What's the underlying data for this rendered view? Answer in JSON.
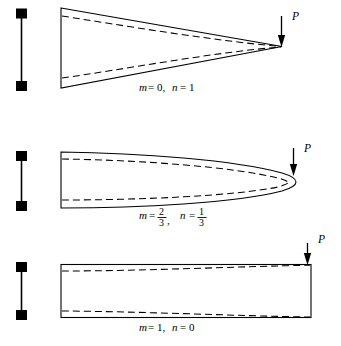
{
  "figure": {
    "name": "column-buckling-modes-figure",
    "background_color": "#ffffff",
    "line_color": "#000000",
    "width": 341,
    "height": 346
  },
  "panels": [
    {
      "id": "panel-1",
      "shape": "triangle",
      "caption": {
        "full": "m = 0, n = 1",
        "m_var": "m",
        "m_eq": "= 0,",
        "n_var": "n",
        "n_eq": "= 1",
        "m_value": "0",
        "n_value": "1"
      },
      "load_label": "P",
      "support_label": "pinned-pinned-support"
    },
    {
      "id": "panel-2",
      "shape": "parabolic-nose",
      "caption": {
        "full": "m = 2/3, n = 1/3",
        "m_var": "m",
        "m_eq": "=",
        "m_num": "2",
        "m_den": "3",
        "m_trail": ",",
        "n_var": "n",
        "n_eq": "=",
        "n_num": "1",
        "n_den": "3",
        "m_value": "2/3",
        "n_value": "1/3"
      },
      "load_label": "P",
      "support_label": "pinned-pinned-support"
    },
    {
      "id": "panel-3",
      "shape": "rectangle",
      "caption": {
        "full": "m = 1, n = 0",
        "m_var": "m",
        "m_eq": "= 1,",
        "n_var": "n",
        "n_eq": "= 0",
        "m_value": "1",
        "n_value": "0"
      },
      "load_label": "P",
      "support_label": "pinned-pinned-support"
    }
  ]
}
